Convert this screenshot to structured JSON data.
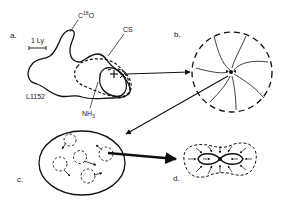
{
  "panels": {
    "a": {
      "label": "a.",
      "scale_bar": "1 Ly",
      "cloud_name": "L1152",
      "tracers": [
        "C18O",
        "CS",
        "NH3"
      ],
      "c18o": {
        "base": "C",
        "sup": "18",
        "tail": "O"
      },
      "cs": "CS",
      "nh3": {
        "base": "NH",
        "sub": "3"
      }
    },
    "b": {
      "label": "b."
    },
    "c": {
      "label": "c."
    },
    "d": {
      "label": "d."
    }
  },
  "colors": {
    "stroke": "#111111",
    "text": "#222222",
    "background": "#ffffff"
  }
}
